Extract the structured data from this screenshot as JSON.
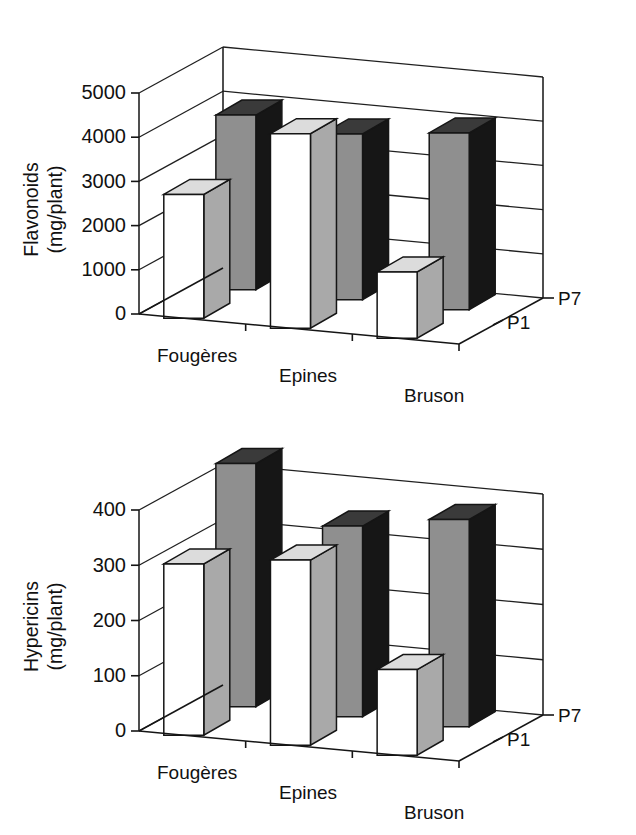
{
  "figure": {
    "panels": [
      "flavonoids-panel",
      "hypericins-panel"
    ]
  },
  "chart_data": [
    {
      "id": "flavonoids",
      "type": "bar",
      "subtype": "3d-grouped-bar",
      "title": "",
      "xlabel": "",
      "ylabel": "Flavonoids\n(mg/plant)",
      "ylabel_line1": "Flavonoids",
      "ylabel_line2": "(mg/plant)",
      "zlabel": "",
      "categories": [
        "Fougères",
        "Epines",
        "Bruson"
      ],
      "series": [
        {
          "name": "P1",
          "values": [
            2800,
            4400,
            1500
          ]
        },
        {
          "name": "P7",
          "values": [
            3950,
            3750,
            4000
          ]
        }
      ],
      "ylim": [
        0,
        5000
      ],
      "yticks": [
        0,
        1000,
        2000,
        3000,
        4000,
        5000
      ],
      "ytick_labels": [
        "0",
        "1000",
        "2000",
        "3000",
        "4000",
        "5000"
      ],
      "grid": true,
      "legend": "depth-axis",
      "depth_labels": [
        "P1",
        "P7"
      ]
    },
    {
      "id": "hypericins",
      "type": "bar",
      "subtype": "3d-grouped-bar",
      "title": "",
      "xlabel": "",
      "ylabel": "Hypericins\n(mg/plant)",
      "ylabel_line1": "Hypericins",
      "ylabel_line2": "(mg/plant)",
      "zlabel": "",
      "categories": [
        "Fougères",
        "Epines",
        "Bruson"
      ],
      "series": [
        {
          "name": "P1",
          "values": [
            310,
            335,
            155
          ]
        },
        {
          "name": "P7",
          "values": [
            440,
            345,
            375
          ]
        }
      ],
      "ylim": [
        0,
        400
      ],
      "yticks": [
        0,
        100,
        200,
        300,
        400
      ],
      "ytick_labels": [
        "0",
        "100",
        "200",
        "300",
        "400"
      ],
      "grid": true,
      "legend": "depth-axis",
      "depth_labels": [
        "P1",
        "P7"
      ]
    }
  ],
  "colors": {
    "p1_front": "#ffffff",
    "p1_side": "#a9a9a9",
    "p1_top": "#dcdcdc",
    "p7_front": "#8f8f8f",
    "p7_side": "#161616",
    "p7_top": "#3a3a3a",
    "line": "#151515",
    "background": "#ffffff"
  }
}
